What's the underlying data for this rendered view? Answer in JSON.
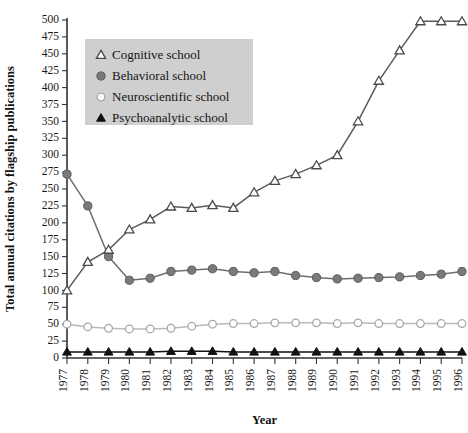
{
  "chart_data": {
    "type": "line",
    "title": "",
    "xlabel": "Year",
    "ylabel": "Total annual citations by flagship publications",
    "x": [
      1977,
      1978,
      1979,
      1980,
      1981,
      1982,
      1983,
      1984,
      1985,
      1986,
      1987,
      1988,
      1989,
      1990,
      1991,
      1992,
      1993,
      1994,
      1995,
      1996
    ],
    "categories": [
      "1977",
      "1978",
      "1979",
      "1980",
      "1981",
      "1982",
      "1983",
      "1984",
      "1985",
      "1986",
      "1987",
      "1988",
      "1989",
      "1990",
      "1991",
      "1992",
      "1993",
      "1994",
      "1995",
      "1996"
    ],
    "xlim": [
      1977,
      1996
    ],
    "ylim": [
      0,
      500
    ],
    "yticks": [
      0,
      25,
      50,
      75,
      100,
      125,
      150,
      175,
      200,
      225,
      250,
      275,
      300,
      325,
      350,
      375,
      400,
      425,
      450,
      475,
      500
    ],
    "grid": false,
    "legend_position": "top-left",
    "series": [
      {
        "name": "Cognitive school",
        "marker": "open-triangle",
        "color": "#5a5a5a",
        "marker_fill": "#ffffff",
        "marker_stroke": "#4a4a4a",
        "values": [
          100,
          142,
          160,
          190,
          205,
          224,
          222,
          226,
          222,
          245,
          262,
          272,
          285,
          300,
          350,
          410,
          455,
          498,
          498,
          498
        ]
      },
      {
        "name": "Behavioral school",
        "marker": "filled-circle",
        "color": "#6e6e6e",
        "marker_fill": "#7a7a7a",
        "marker_stroke": "#5a5a5a",
        "values": [
          272,
          225,
          150,
          115,
          118,
          128,
          130,
          132,
          128,
          126,
          128,
          122,
          119,
          117,
          118,
          119,
          120,
          122,
          124,
          128
        ]
      },
      {
        "name": "Neuroscientific school",
        "marker": "open-circle",
        "color": "#b9b9b9",
        "marker_fill": "#ffffff",
        "marker_stroke": "#a8a8a8",
        "values": [
          50,
          46,
          44,
          43,
          43,
          44,
          47,
          50,
          51,
          51,
          52,
          52,
          52,
          51,
          52,
          51,
          51,
          51,
          51,
          51
        ]
      },
      {
        "name": "Psychoanalytic school",
        "marker": "filled-triangle",
        "color": "#111111",
        "marker_fill": "#111111",
        "marker_stroke": "#111111",
        "values": [
          9,
          9,
          9,
          9,
          9,
          10,
          10,
          10,
          9,
          9,
          9,
          9,
          9,
          9,
          9,
          9,
          9,
          9,
          9,
          9
        ]
      }
    ],
    "legend": [
      {
        "label": "Cognitive school",
        "marker": "open-triangle"
      },
      {
        "label": "Behavioral school",
        "marker": "filled-circle"
      },
      {
        "label": "Neuroscientific school",
        "marker": "open-circle"
      },
      {
        "label": "Psychoanalytic school",
        "marker": "filled-triangle"
      }
    ]
  }
}
